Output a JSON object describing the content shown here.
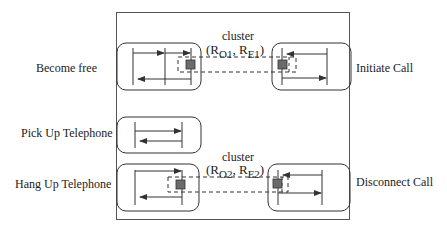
{
  "diagram": {
    "frame": {
      "x": 116,
      "y": 12,
      "width": 233,
      "height": 207
    },
    "colors": {
      "stroke": "#333333",
      "box_stroke": "#444444",
      "node_fill": "#6b6b6b",
      "dashed": "#333333"
    },
    "states": [
      {
        "id": "become-free",
        "label": "Become free",
        "label_x": 36,
        "label_y": 61
      },
      {
        "id": "initiate-call",
        "label": "Initiate Call",
        "label_x": 356,
        "label_y": 61
      },
      {
        "id": "pick-up-telephone",
        "label": "Pick Up Telephone",
        "label_x": 21,
        "label_y": 126
      },
      {
        "id": "hang-up-telephone",
        "label": "Hang Up Telephone",
        "label_x": 15,
        "label_y": 177
      },
      {
        "id": "disconnect-call",
        "label": "Disconnect Call",
        "label_x": 356,
        "label_y": 175
      }
    ],
    "clusters": [
      {
        "id": "cluster-1",
        "title": "cluster",
        "open": "(R",
        "sub1": "O1",
        "sep": ", R",
        "sub2": "E1",
        "close": ")"
      },
      {
        "id": "cluster-2",
        "title": "cluster",
        "open": "(R",
        "sub1": "O2",
        "sep": ", R",
        "sub2": "E2",
        "close": ")"
      }
    ]
  }
}
